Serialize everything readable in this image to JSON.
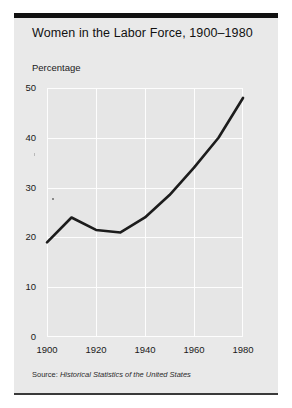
{
  "figure": {
    "title": "Women in the Labor Force, 1900–1980",
    "ylabel": "Percentage",
    "source_label": "Source:",
    "source_title": "Historical Statistics of the United States",
    "background_color": "#e9e9e9",
    "plot_background_color": "#e6e6e6",
    "line_color": "#1c1c1c",
    "grid_color": "#fdfdfd",
    "rule_color": "#111111"
  },
  "chart_data": {
    "type": "line",
    "title": "Women in the Labor Force, 1900–1980",
    "subtitle": "",
    "xlabel": "",
    "ylabel": "Percentage",
    "x": [
      1900,
      1910,
      1920,
      1930,
      1940,
      1950,
      1960,
      1970,
      1980
    ],
    "values": [
      19.0,
      24.0,
      21.5,
      21.0,
      24.0,
      28.5,
      34.0,
      40.0,
      48.0
    ],
    "series": [
      {
        "name": "Percentage of labor force that is women",
        "values": [
          19.0,
          24.0,
          21.5,
          21.0,
          24.0,
          28.5,
          34.0,
          40.0,
          48.0
        ]
      }
    ],
    "xlim": [
      1900,
      1980
    ],
    "ylim": [
      0,
      50
    ],
    "xticks": [
      1900,
      1920,
      1940,
      1960,
      1980
    ],
    "yticks": [
      0,
      10,
      20,
      30,
      40,
      50
    ],
    "xtick_labels": [
      "1900",
      "1920",
      "1940",
      "1960",
      "1980"
    ],
    "ytick_labels": [
      "0",
      "10",
      "20",
      "30",
      "40",
      "50"
    ],
    "grid": true,
    "grid_axis": "both",
    "legend": false,
    "legend_position": "none",
    "annotations": [],
    "source": "Source: Historical Statistics of the United States"
  }
}
